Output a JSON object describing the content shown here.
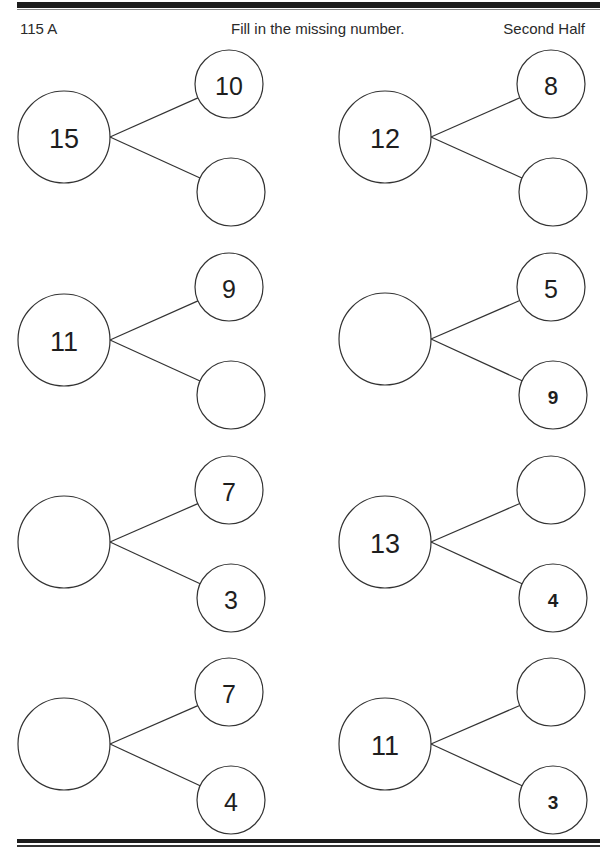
{
  "header": {
    "left": "115 A",
    "center": "Fill in the missing number.",
    "right": "Second Half"
  },
  "bonds": [
    {
      "whole": "15",
      "top": "10",
      "bottom": "",
      "bottom_bold": false,
      "cx": 64,
      "cy": 137,
      "tx": 229,
      "ty": 84,
      "bx": 231,
      "by": 192
    },
    {
      "whole": "12",
      "top": "8",
      "bottom": "",
      "bottom_bold": false,
      "cx": 385,
      "cy": 137,
      "tx": 551,
      "ty": 84,
      "bx": 553,
      "by": 192
    },
    {
      "whole": "11",
      "top": "9",
      "bottom": "",
      "bottom_bold": false,
      "cx": 64,
      "cy": 340,
      "tx": 229,
      "ty": 287,
      "bx": 231,
      "by": 395
    },
    {
      "whole": "",
      "top": "5",
      "bottom": "9",
      "bottom_bold": true,
      "cx": 385,
      "cy": 339,
      "tx": 551,
      "ty": 287,
      "bx": 553,
      "by": 395
    },
    {
      "whole": "",
      "top": "7",
      "bottom": "3",
      "bottom_bold": false,
      "cx": 64,
      "cy": 542,
      "tx": 229,
      "ty": 490,
      "bx": 231,
      "by": 598
    },
    {
      "whole": "13",
      "top": "",
      "bottom": "4",
      "bottom_bold": true,
      "cx": 385,
      "cy": 542,
      "tx": 551,
      "ty": 490,
      "bx": 553,
      "by": 598
    },
    {
      "whole": "",
      "top": "7",
      "bottom": "4",
      "bottom_bold": false,
      "cx": 64,
      "cy": 744,
      "tx": 229,
      "ty": 692,
      "bx": 231,
      "by": 800
    },
    {
      "whole": "11",
      "top": "",
      "bottom": "3",
      "bottom_bold": true,
      "cx": 385,
      "cy": 744,
      "tx": 551,
      "ty": 692,
      "bx": 553,
      "by": 800
    }
  ]
}
